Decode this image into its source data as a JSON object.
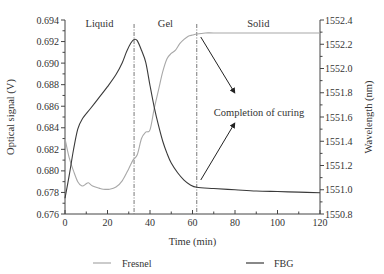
{
  "chart_data": {
    "type": "line",
    "title": "",
    "xlabel": "Time (min)",
    "ylabel_left": "Optical signal (V)",
    "ylabel_right": "Wavelength (nm)",
    "xlim": [
      0,
      120
    ],
    "ylim_left": [
      0.676,
      0.694
    ],
    "ylim_right": [
      1550.8,
      1552.4
    ],
    "x_ticks": [
      "0",
      "20",
      "40",
      "60",
      "80",
      "100",
      "120"
    ],
    "y_ticks_left": [
      "0.676",
      "0.678",
      "0.680",
      "0.682",
      "0.684",
      "0.686",
      "0.688",
      "0.690",
      "0.692",
      "0.694"
    ],
    "y_ticks_right": [
      "1550.8",
      "1551.0",
      "1551.2",
      "1551.4",
      "1551.6",
      "1551.8",
      "1552.0",
      "1552.2",
      "1552.4"
    ],
    "grid": false,
    "legend_position": "bottom",
    "phase_boundaries": [
      32.5,
      62
    ],
    "phase_labels": [
      "Liquid",
      "Gel",
      "Solid"
    ],
    "annotation": "Completion of curing",
    "series": [
      {
        "name": "Fresnel",
        "axis": "left",
        "color": "#a8a8a8",
        "x": [
          0,
          2,
          4,
          6,
          8,
          10,
          11,
          13,
          16,
          18,
          21,
          24,
          27,
          30,
          32,
          34,
          36,
          38,
          40,
          42,
          44,
          46,
          48,
          50,
          52,
          54,
          56,
          58,
          60,
          62,
          66,
          70,
          80,
          100,
          120
        ],
        "values": [
          0.683,
          0.6812,
          0.68,
          0.679,
          0.6786,
          0.6788,
          0.6789,
          0.6786,
          0.6784,
          0.6783,
          0.6783,
          0.6785,
          0.6791,
          0.6802,
          0.681,
          0.6815,
          0.683,
          0.6836,
          0.6838,
          0.6858,
          0.6875,
          0.6892,
          0.6904,
          0.6909,
          0.6912,
          0.6918,
          0.6922,
          0.6925,
          0.6926,
          0.6927,
          0.6928,
          0.6928,
          0.6928,
          0.6928,
          0.6928
        ]
      },
      {
        "name": "FBG",
        "axis": "right",
        "color": "#3a3a3a",
        "x": [
          0,
          2,
          4,
          6,
          8,
          12,
          16,
          20,
          24,
          27,
          29,
          31,
          32.5,
          34,
          36,
          38,
          40,
          42,
          44,
          46,
          48,
          50,
          53,
          56,
          59,
          62,
          70,
          80,
          90,
          100,
          110,
          120
        ],
        "values": [
          1550.93,
          1551.12,
          1551.33,
          1551.5,
          1551.58,
          1551.67,
          1551.76,
          1551.85,
          1551.95,
          1552.05,
          1552.14,
          1552.21,
          1552.24,
          1552.23,
          1552.15,
          1552.05,
          1551.86,
          1551.68,
          1551.53,
          1551.4,
          1551.3,
          1551.22,
          1551.14,
          1551.08,
          1551.04,
          1551.02,
          1551.01,
          1551.0,
          1550.99,
          1550.985,
          1550.98,
          1550.975
        ]
      }
    ]
  },
  "legend": {
    "fresnel_label": "Fresnel",
    "fbg_label": "FBG"
  }
}
